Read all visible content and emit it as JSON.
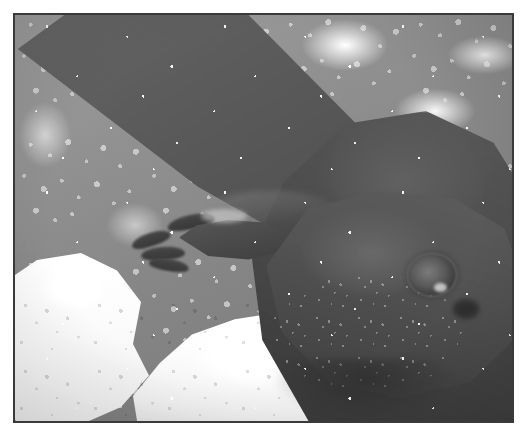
{
  "page": {
    "width": 528,
    "height": 441,
    "background_color": "#ffffff",
    "rendering": "grayscale halftone scan of a printed photograph"
  },
  "photo": {
    "frame": {
      "left": 13,
      "top": 13,
      "width": 501,
      "height": 410,
      "border_color": "#3a3a3a",
      "border_width": 2
    },
    "subject": "large aquatic salamander (hellbender / giant salamander) resting on pale rocks",
    "orientation": "head at lower right, body and forelimb extending to upper left",
    "palette": {
      "background_rock_mid": "#8f8f8f",
      "background_rock_dark": "#7b7b7b",
      "highlight_rock_white": "#fbfbfb",
      "animal_body": "#515151",
      "animal_head": "#565656",
      "animal_shadow": "#3c3c3c",
      "eye_dark": "#2e2e2e",
      "frame_border": "#3a3a3a"
    },
    "elements": {
      "forelimb_label": "diagonal forelimb crossing the upper-left of the frame",
      "foot_label": "splayed webbed foot with four visible toes",
      "head_label": "broad flattened head and snout",
      "eye_label": "small round eye with pale highlight",
      "nostril_label": "dark pit beside the eye",
      "body_label": "dark body mass occupying the right side",
      "rock_left_label": "bright white rock at lower left",
      "rock_center_label": "bright white rock below the head",
      "rock_right_label": "small pale rock at the right edge",
      "gravel_label": "mottled speckled wet gravel background"
    }
  }
}
